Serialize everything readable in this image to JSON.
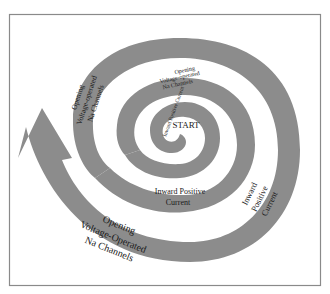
{
  "diagram": {
    "colors": {
      "background": "#ffffff",
      "band": "#8c8c8c",
      "frame": "#8a8a8a",
      "text": "#1a1a1a"
    },
    "start_label": "START",
    "labels": {
      "inner_current": "Inward Positive Current",
      "inner_opening": [
        "Opening",
        "Voltage-operated",
        "Na Channels"
      ],
      "middle_opening_left": [
        "Opening",
        "Voltage-operated",
        "Na Channels"
      ],
      "middle_current_bottom": [
        "Inward Positive",
        "Current"
      ],
      "outer_current_right": [
        "Inward",
        "Positive",
        "Current"
      ],
      "outer_opening_bottom": [
        "Opening",
        "Voltage-Operated",
        "Na Channels"
      ]
    },
    "arrow": "up-left-arrowhead"
  }
}
